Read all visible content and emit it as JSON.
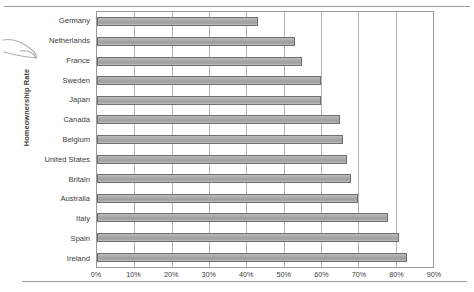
{
  "chart_data": {
    "type": "bar",
    "orientation": "horizontal",
    "title": "",
    "xlabel": "",
    "ylabel": "Homeownership Rate",
    "xlim": [
      0,
      90
    ],
    "xtick_labels": [
      "0%",
      "10%",
      "20%",
      "30%",
      "40%",
      "50%",
      "60%",
      "70%",
      "80%",
      "90%"
    ],
    "xtick_values": [
      0,
      10,
      20,
      30,
      40,
      50,
      60,
      70,
      80,
      90
    ],
    "grid": true,
    "legend": false,
    "bar_color": "#a8a8a8",
    "bar_edge_color": "#6f6f6f",
    "categories": [
      "Germany",
      "Netherlands",
      "France",
      "Sweden",
      "Japan",
      "Canada",
      "Belgium",
      "United States",
      "Britain",
      "Australia",
      "Italy",
      "Spain",
      "Ireland"
    ],
    "values": [
      43,
      53,
      55,
      60,
      60,
      65,
      66,
      67,
      68,
      70,
      78,
      81,
      83
    ]
  },
  "annotations": {
    "arrow": "hand-drawn-arrow"
  }
}
